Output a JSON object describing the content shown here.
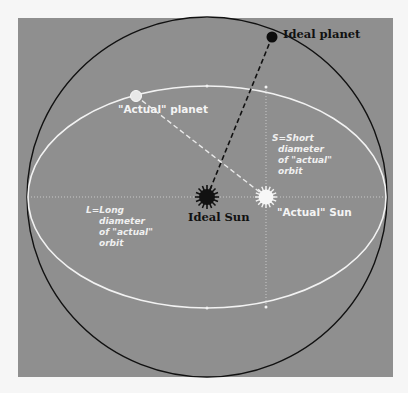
{
  "diagram": {
    "colors": {
      "page_background": "#f6f6f6",
      "panel": "#8f8f8f",
      "ideal_orbit": "#111111",
      "actual_orbit": "#f2f2f2",
      "ideal_label": "#111111",
      "actual_label": "#f4f4f4",
      "axis_label": "#f0f0f0"
    },
    "labels": {
      "ideal_planet": "Ideal planet",
      "actual_planet": "\"Actual\" planet",
      "ideal_sun": "Ideal Sun",
      "actual_sun": "\"Actual\" Sun",
      "short_axis": [
        "S=Short",
        "diameter",
        "of \"actual\"",
        "orbit"
      ],
      "long_axis": [
        "L=Long",
        "diameter",
        "of \"actual\"",
        "orbit"
      ]
    },
    "elements": {
      "ideal_orbit": {
        "shape": "circle",
        "cx": 207,
        "cy": 197,
        "r": 180
      },
      "actual_orbit": {
        "shape": "ellipse",
        "cx": 207,
        "cy": 197,
        "rx": 179,
        "ry": 111
      },
      "ideal_planet": {
        "x": 272,
        "y": 37
      },
      "actual_planet": {
        "x": 136,
        "y": 96
      },
      "ideal_sun": {
        "x": 207,
        "y": 197
      },
      "actual_sun": {
        "x": 266,
        "y": 197
      }
    }
  }
}
